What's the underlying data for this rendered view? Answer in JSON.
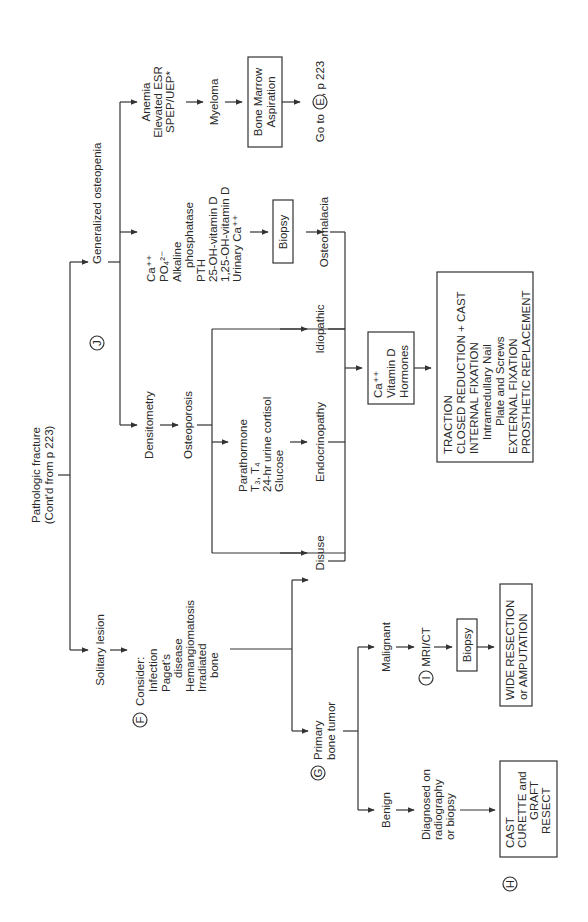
{
  "diagram": {
    "orientation": "rotated 90 degrees counter-clockwise",
    "root": {
      "line1": "Pathologic fracture",
      "line2": "(Cont'd from p 223)"
    },
    "branches": {
      "solitary": {
        "label": "Solitary lesion",
        "marker_f": "F",
        "consider": [
          "Consider:",
          "Infection",
          "Paget's",
          "disease",
          "Hemangiomatosis",
          "Irradiated",
          "bone"
        ],
        "primary": {
          "marker": "G",
          "line1": "Primary",
          "line2": "bone tumor"
        },
        "benign": {
          "label": "Benign",
          "diagnosed": [
            "Diagnosed on",
            "radiography",
            "or biopsy"
          ],
          "marker_h": "H",
          "treatment": [
            "CAST",
            "CURETTE and",
            "GRAFT",
            "RESECT"
          ]
        },
        "malignant": {
          "label": "Malignant",
          "marker_i": "I",
          "imaging": "MRI/CT",
          "biopsy": "Biopsy",
          "treatment": [
            "WIDE RESECTION",
            "or AMPUTATION"
          ]
        }
      },
      "generalized": {
        "marker_j": "J",
        "label": "Generalized osteopenia",
        "densitometry": "Densitometry",
        "osteoporosis": "Osteoporosis",
        "tests": [
          "Parathormone",
          "T₃, T₄",
          "24-hr urine cortisol",
          "Glucose"
        ],
        "causes": [
          "Disuse",
          "Endocrinopathy",
          "Idiopathic"
        ],
        "labs": [
          "Ca⁺⁺",
          "PO₄²⁻",
          "Alkaline",
          "phosphatase",
          "PTH",
          "25-OH-vitamin D",
          "1,25-OH-vitamin D",
          "Urinary Ca⁺⁺"
        ],
        "lab_biopsy": "Biopsy",
        "osteomalacia": "Osteomalacia",
        "myeloma_signs": [
          "Anemia",
          "Elevated ESR",
          "SPEP/UEP*"
        ],
        "myeloma": "Myeloma",
        "bone_marrow": [
          "Bone Marrow",
          "Aspiration"
        ],
        "goto": {
          "prefix": "Go to",
          "marker": "E",
          "suffix": ", p 223"
        }
      }
    },
    "supplement": [
      "Ca⁺⁺",
      "Vitamin D",
      "Hormones"
    ],
    "final_treatment": [
      "TRACTION",
      "CLOSED REDUCTION + CAST",
      "INTERNAL FIXATION",
      "Intramedullary Nail",
      "Plate and Screws",
      "EXTERNAL FIXATION",
      "PROSTHETIC REPLACEMENT"
    ]
  }
}
